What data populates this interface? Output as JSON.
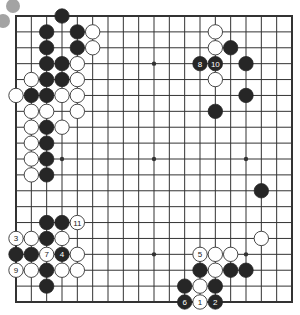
{
  "diagram": {
    "type": "go-board",
    "size": 19,
    "colors": {
      "background": "#ffffff",
      "line": "#333333",
      "black_stone": "#262626",
      "white_stone": "#ffffff",
      "white_stroke": "#333333",
      "decor_circle": "#a3a3a3"
    },
    "decor_circles": [
      {
        "cx": 13,
        "cy": 6,
        "r": 7
      },
      {
        "cx": 3,
        "cy": 21,
        "r": 7
      }
    ],
    "star_points": [
      [
        3,
        9
      ],
      [
        9,
        3
      ],
      [
        9,
        9
      ],
      [
        15,
        9
      ],
      [
        9,
        15
      ],
      [
        15,
        15
      ],
      [
        3,
        3
      ],
      [
        3,
        15
      ],
      [
        15,
        3
      ]
    ],
    "black_stones": [
      {
        "col": 3,
        "row": 0
      },
      {
        "col": 2,
        "row": 1
      },
      {
        "col": 4,
        "row": 1
      },
      {
        "col": 2,
        "row": 2
      },
      {
        "col": 4,
        "row": 2
      },
      {
        "col": 2,
        "row": 3
      },
      {
        "col": 3,
        "row": 3
      },
      {
        "col": 2,
        "row": 4
      },
      {
        "col": 3,
        "row": 4
      },
      {
        "col": 1,
        "row": 5
      },
      {
        "col": 2,
        "row": 5
      },
      {
        "col": 2,
        "row": 7
      },
      {
        "col": 2,
        "row": 8
      },
      {
        "col": 2,
        "row": 9
      },
      {
        "col": 2,
        "row": 10
      },
      {
        "col": 2,
        "row": 13
      },
      {
        "col": 3,
        "row": 13
      },
      {
        "col": 2,
        "row": 14
      },
      {
        "col": 0,
        "row": 15
      },
      {
        "col": 1,
        "row": 15
      },
      {
        "col": 3,
        "row": 15,
        "label": "4"
      },
      {
        "col": 2,
        "row": 16
      },
      {
        "col": 2,
        "row": 17
      },
      {
        "col": 14,
        "row": 2
      },
      {
        "col": 12,
        "row": 3,
        "label": "8"
      },
      {
        "col": 13,
        "row": 3,
        "label": "10"
      },
      {
        "col": 15,
        "row": 3
      },
      {
        "col": 15,
        "row": 5
      },
      {
        "col": 13,
        "row": 6
      },
      {
        "col": 16,
        "row": 11
      },
      {
        "col": 12,
        "row": 16
      },
      {
        "col": 14,
        "row": 16
      },
      {
        "col": 15,
        "row": 16
      },
      {
        "col": 11,
        "row": 17
      },
      {
        "col": 13,
        "row": 17
      },
      {
        "col": 11,
        "row": 18,
        "label": "6"
      },
      {
        "col": 13,
        "row": 18,
        "label": "2"
      }
    ],
    "white_stones": [
      {
        "col": 5,
        "row": 1
      },
      {
        "col": 5,
        "row": 2
      },
      {
        "col": 4,
        "row": 3
      },
      {
        "col": 1,
        "row": 4
      },
      {
        "col": 4,
        "row": 4
      },
      {
        "col": 0,
        "row": 5
      },
      {
        "col": 3,
        "row": 5
      },
      {
        "col": 4,
        "row": 5
      },
      {
        "col": 1,
        "row": 6
      },
      {
        "col": 2,
        "row": 6
      },
      {
        "col": 4,
        "row": 6
      },
      {
        "col": 1,
        "row": 7
      },
      {
        "col": 3,
        "row": 7
      },
      {
        "col": 1,
        "row": 8
      },
      {
        "col": 1,
        "row": 9
      },
      {
        "col": 1,
        "row": 10
      },
      {
        "col": 4,
        "row": 13,
        "label": "11"
      },
      {
        "col": 0,
        "row": 14,
        "label": "3"
      },
      {
        "col": 1,
        "row": 14
      },
      {
        "col": 3,
        "row": 14
      },
      {
        "col": 2,
        "row": 15,
        "label": "7"
      },
      {
        "col": 4,
        "row": 15
      },
      {
        "col": 0,
        "row": 16,
        "label": "9"
      },
      {
        "col": 1,
        "row": 16
      },
      {
        "col": 3,
        "row": 16
      },
      {
        "col": 4,
        "row": 16
      },
      {
        "col": 13,
        "row": 1
      },
      {
        "col": 13,
        "row": 2
      },
      {
        "col": 13,
        "row": 4
      },
      {
        "col": 16,
        "row": 14
      },
      {
        "col": 12,
        "row": 15,
        "label": "5"
      },
      {
        "col": 13,
        "row": 15
      },
      {
        "col": 14,
        "row": 15
      },
      {
        "col": 13,
        "row": 16
      },
      {
        "col": 12,
        "row": 17
      },
      {
        "col": 12,
        "row": 18,
        "label": "1"
      }
    ]
  }
}
